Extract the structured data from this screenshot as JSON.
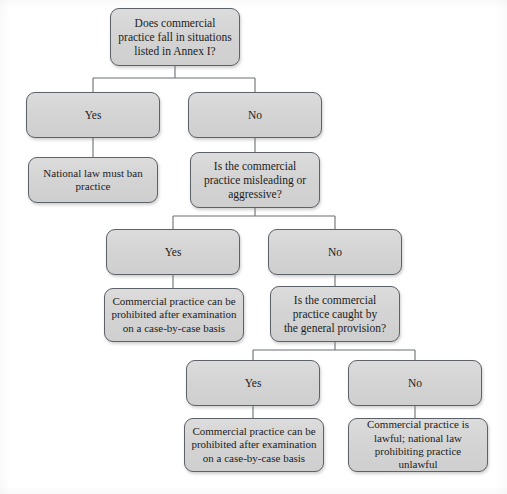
{
  "diagram": {
    "colors": {
      "node_fill": "#d6d6d6",
      "node_border": "#5d6268",
      "connector": "#6b6f74",
      "text": "#1c1c1c",
      "page_background": "#ffffff"
    },
    "nodes": [
      {
        "id": "q1",
        "kind": "question",
        "text": "Does commercial\npractice fall in situations\nlisted in Annex I?",
        "x": 110,
        "y": 8,
        "w": 130,
        "h": 58
      },
      {
        "id": "q1-yes",
        "kind": "answer",
        "text": "Yes",
        "x": 26,
        "y": 92,
        "w": 134,
        "h": 46
      },
      {
        "id": "q1-no",
        "kind": "answer",
        "text": "No",
        "x": 188,
        "y": 92,
        "w": 134,
        "h": 46
      },
      {
        "id": "r1",
        "kind": "outcome",
        "text": "National law must ban\npractice",
        "x": 28,
        "y": 157,
        "w": 130,
        "h": 46
      },
      {
        "id": "q2",
        "kind": "question",
        "text": "Is the commercial\npractice misleading or\naggressive?",
        "x": 190,
        "y": 152,
        "w": 130,
        "h": 56
      },
      {
        "id": "q2-yes",
        "kind": "answer",
        "text": "Yes",
        "x": 106,
        "y": 229,
        "w": 134,
        "h": 46
      },
      {
        "id": "q2-no",
        "kind": "answer",
        "text": "No",
        "x": 268,
        "y": 229,
        "w": 134,
        "h": 46
      },
      {
        "id": "r2",
        "kind": "outcome",
        "text": "Commercial practice can be\nprohibited after examination\non a case-by-case basis",
        "x": 104,
        "y": 288,
        "w": 140,
        "h": 54
      },
      {
        "id": "q3",
        "kind": "question",
        "text": "Is the commercial\npractice caught by\nthe general provision?",
        "x": 270,
        "y": 286,
        "w": 130,
        "h": 56
      },
      {
        "id": "q3-yes",
        "kind": "answer",
        "text": "Yes",
        "x": 186,
        "y": 360,
        "w": 134,
        "h": 46
      },
      {
        "id": "q3-no",
        "kind": "answer",
        "text": "No",
        "x": 348,
        "y": 360,
        "w": 134,
        "h": 46
      },
      {
        "id": "r3",
        "kind": "outcome",
        "text": "Commercial practice can be\nprohibited after examination\non a case-by-case basis",
        "x": 184,
        "y": 418,
        "w": 140,
        "h": 54
      },
      {
        "id": "r4",
        "kind": "outcome",
        "text": "Commercial practice is\nlawful; national law\nprohibiting practice unlawful",
        "x": 348,
        "y": 418,
        "w": 140,
        "h": 54
      }
    ],
    "connectors": [
      {
        "id": "c-q1-split",
        "from": "q1",
        "to": [
          "q1-yes",
          "q1-no"
        ],
        "path": "M175,66 L175,78 M93,78 L255,78 M93,78 L93,92 M255,78 L255,92"
      },
      {
        "id": "c-yes-r1",
        "from": "q1-yes",
        "to": [
          "r1"
        ],
        "path": "M93,138 L93,157"
      },
      {
        "id": "c-no-q2",
        "from": "q1-no",
        "to": [
          "q2"
        ],
        "path": "M255,138 L255,152"
      },
      {
        "id": "c-q2-split",
        "from": "q2",
        "to": [
          "q2-yes",
          "q2-no"
        ],
        "path": "M255,208 L255,216 M173,216 L335,216 M173,216 L173,229 M335,216 L335,229"
      },
      {
        "id": "c-yes-r2",
        "from": "q2-yes",
        "to": [
          "r2"
        ],
        "path": "M173,275 L173,288"
      },
      {
        "id": "c-no-q3",
        "from": "q2-no",
        "to": [
          "q3"
        ],
        "path": "M335,275 L335,286"
      },
      {
        "id": "c-q3-split",
        "from": "q3",
        "to": [
          "q3-yes",
          "q3-no"
        ],
        "path": "M335,342 L335,350 M253,350 L415,350 M253,350 L253,360 M415,350 L415,360"
      },
      {
        "id": "c-yes-r3",
        "from": "q3-yes",
        "to": [
          "r3"
        ],
        "path": "M253,406 L253,418"
      },
      {
        "id": "c-no-r4",
        "from": "q3-no",
        "to": [
          "r4"
        ],
        "path": "M415,406 L415,418"
      }
    ]
  }
}
